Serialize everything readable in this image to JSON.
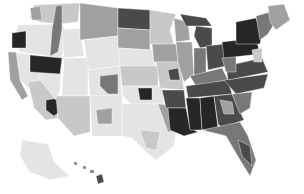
{
  "map": {
    "type": "choropleth",
    "subject": "United States counties/regions shaded in grayscale",
    "palette": {
      "level_1": "#e4e4e4",
      "level_2": "#c8c8c8",
      "level_3": "#a0a0a0",
      "level_4": "#787878",
      "level_5": "#4a4a4a",
      "level_6": "#262626"
    },
    "background": "#ffffff",
    "regions": [
      {
        "id": "washington",
        "level": 2,
        "points": "34,5 80,3 78,22 60,24 40,22 30,18"
      },
      {
        "id": "wa-west",
        "level": 3,
        "points": "30,8 40,6 42,20 32,20"
      },
      {
        "id": "oregon",
        "level": 1,
        "points": "18,25 60,24 66,30 62,58 20,52 14,38"
      },
      {
        "id": "oregon-dark",
        "level": 6,
        "points": "12,33 26,31 26,48 12,48"
      },
      {
        "id": "ca-north",
        "level": 1,
        "points": "14,52 40,56 40,80 30,90 20,80 12,66"
      },
      {
        "id": "ca-coast",
        "level": 3,
        "points": "8,52 16,52 20,80 28,96 22,100 10,80"
      },
      {
        "id": "ca-south",
        "level": 2,
        "points": "28,82 44,80 56,100 58,118 46,120 34,108"
      },
      {
        "id": "la-county",
        "level": 6,
        "points": "46,100 60,98 64,108 54,116 46,110"
      },
      {
        "id": "nevada",
        "level": 1,
        "points": "40,56 62,58 60,90 56,100 40,80"
      },
      {
        "id": "nv-dark",
        "level": 6,
        "points": "30,55 62,58 60,74 30,72"
      },
      {
        "id": "idaho-strip",
        "level": 4,
        "points": "56,6 62,5 62,30 58,52 50,56 52,30"
      },
      {
        "id": "idaho",
        "level": 1,
        "points": "62,30 80,28 84,56 64,58"
      },
      {
        "id": "montana",
        "level": 3,
        "points": "80,3 118,8 118,36 80,40"
      },
      {
        "id": "wyoming",
        "level": 1,
        "points": "84,40 118,36 120,66 88,70"
      },
      {
        "id": "utah",
        "level": 1,
        "points": "64,58 88,58 88,96 62,96"
      },
      {
        "id": "colorado",
        "level": 1,
        "points": "88,70 120,66 122,96 90,96"
      },
      {
        "id": "co-accent",
        "level": 4,
        "points": "100,76 118,74 118,94 108,94 100,86"
      },
      {
        "id": "arizona",
        "level": 2,
        "points": "56,96 90,96 90,132 74,136 58,118"
      },
      {
        "id": "new-mexico",
        "level": 1,
        "points": "90,96 122,96 122,136 92,136"
      },
      {
        "id": "nm-accent",
        "level": 3,
        "points": "96,110 112,108 112,124 98,124"
      },
      {
        "id": "north-dakota",
        "level": 5,
        "points": "118,8 150,10 150,30 118,28"
      },
      {
        "id": "south-dakota",
        "level": 3,
        "points": "118,28 150,30 150,50 118,48"
      },
      {
        "id": "nebraska",
        "level": 1,
        "points": "118,48 152,50 156,66 120,66"
      },
      {
        "id": "kansas",
        "level": 2,
        "points": "120,66 158,66 158,86 122,86"
      },
      {
        "id": "oklahoma",
        "level": 1,
        "points": "122,86 162,86 164,104 130,104 122,94"
      },
      {
        "id": "ok-dark",
        "level": 6,
        "points": "138,88 152,88 152,100 140,100"
      },
      {
        "id": "texas",
        "level": 1,
        "points": "122,104 164,104 178,120 174,146 156,160 144,150 132,138 122,136"
      },
      {
        "id": "tx-east",
        "level": 3,
        "points": "158,104 178,106 180,130 168,132"
      },
      {
        "id": "tx-south",
        "level": 2,
        "points": "140,130 160,132 156,150 146,148"
      },
      {
        "id": "minnesota",
        "level": 2,
        "points": "150,10 176,14 170,30 174,44 150,44"
      },
      {
        "id": "iowa",
        "level": 3,
        "points": "152,44 176,44 178,62 154,62"
      },
      {
        "id": "missouri",
        "level": 2,
        "points": "156,62 180,62 184,90 160,88"
      },
      {
        "id": "mo-dark",
        "level": 5,
        "points": "168,70 178,68 180,80 170,80"
      },
      {
        "id": "arkansas",
        "level": 5,
        "points": "162,90 184,90 186,108 166,108"
      },
      {
        "id": "louisiana",
        "level": 6,
        "points": "168,108 186,108 190,128 198,132 184,136 170,130"
      },
      {
        "id": "wisconsin",
        "level": 3,
        "points": "174,18 188,22 190,40 176,42"
      },
      {
        "id": "illinois",
        "level": 3,
        "points": "176,42 192,42 194,74 184,82 178,62"
      },
      {
        "id": "michigan-up",
        "level": 5,
        "points": "180,14 206,18 212,26 186,26"
      },
      {
        "id": "michigan",
        "level": 5,
        "points": "196,26 212,28 212,46 200,48 194,36"
      },
      {
        "id": "indiana",
        "level": 4,
        "points": "194,48 206,48 206,74 194,76"
      },
      {
        "id": "ohio",
        "level": 5,
        "points": "206,46 224,44 226,66 208,70"
      },
      {
        "id": "kentucky",
        "level": 4,
        "points": "190,76 222,68 228,80 196,86"
      },
      {
        "id": "tennessee",
        "level": 5,
        "points": "186,86 228,80 232,94 188,98"
      },
      {
        "id": "mississippi",
        "level": 6,
        "points": "186,98 200,98 202,130 190,130"
      },
      {
        "id": "alabama",
        "level": 6,
        "points": "200,98 214,96 218,128 202,130"
      },
      {
        "id": "georgia",
        "level": 5,
        "points": "214,96 232,94 244,120 222,128 218,124"
      },
      {
        "id": "ga-accent",
        "level": 3,
        "points": "220,100 232,102 234,114 224,114"
      },
      {
        "id": "florida",
        "level": 4,
        "points": "202,130 240,122 248,136 256,160 250,176 240,160 226,136"
      },
      {
        "id": "fl-dark",
        "level": 5,
        "points": "238,140 250,146 252,166 242,156"
      },
      {
        "id": "south-carolina",
        "level": 4,
        "points": "232,94 252,92 250,108 240,114"
      },
      {
        "id": "north-carolina",
        "level": 5,
        "points": "224,80 268,74 264,88 236,94"
      },
      {
        "id": "virginia",
        "level": 5,
        "points": "226,66 262,58 268,72 228,80"
      },
      {
        "id": "west-virginia",
        "level": 4,
        "points": "222,58 236,56 236,72 226,72"
      },
      {
        "id": "pennsylvania",
        "level": 6,
        "points": "222,42 256,38 260,54 224,58"
      },
      {
        "id": "new-york",
        "level": 6,
        "points": "236,22 256,18 262,34 260,44 236,44"
      },
      {
        "id": "new-england",
        "level": 4,
        "points": "256,16 270,12 274,24 268,34 260,40 258,28"
      },
      {
        "id": "maine",
        "level": 3,
        "points": "268,6 284,4 290,20 276,30 270,22"
      },
      {
        "id": "nj-md",
        "level": 2,
        "points": "252,50 262,48 262,62 254,62"
      },
      {
        "id": "alaska",
        "level": 1,
        "points": "22,140 48,144 54,162 70,176 50,180 30,172 20,156"
      },
      {
        "id": "hawaii-big",
        "level": 5,
        "points": "96,176 102,174 104,182 98,184"
      },
      {
        "id": "hawaii-1",
        "level": 4,
        "points": "74,162 77,162 77,165 74,165"
      },
      {
        "id": "hawaii-2",
        "level": 4,
        "points": "83,166 86,166 86,169 83,169"
      },
      {
        "id": "hawaii-3",
        "level": 4,
        "points": "90,170 94,170 94,173 90,173"
      }
    ]
  }
}
